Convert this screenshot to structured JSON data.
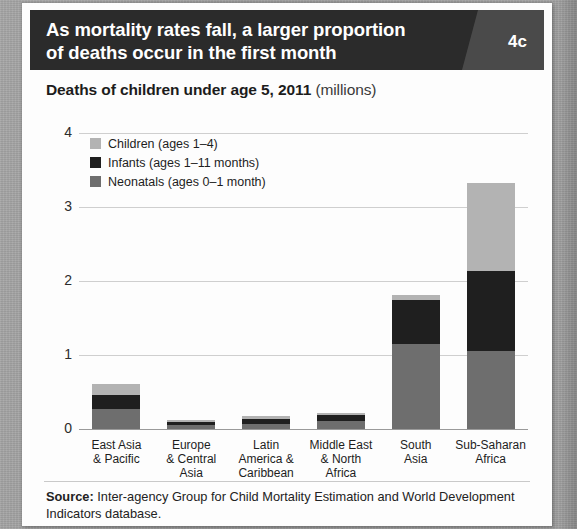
{
  "figure": {
    "badge": "4c",
    "title_lines": [
      "As mortality rates fall, a larger proportion",
      "of deaths occur in the first month"
    ],
    "subtitle_main": "Deaths of children under age 5, 2011",
    "subtitle_units": "(millions)",
    "source_label": "Source:",
    "source_text": " Inter-agency Group for Child Mortality Estimation and World Development Indicators database."
  },
  "colors": {
    "title_band": "#2b2b2b",
    "badge_panel": "#4a4a4a",
    "children": "#b3b3b3",
    "infants": "#1f1f1f",
    "neonatals": "#6e6e6e",
    "gridline": "#cfcfcf",
    "page_background": "#9f9f9f",
    "card_background": "#fdfdfd"
  },
  "chart_data": {
    "type": "bar",
    "stacked": true,
    "title": "Deaths of children under age 5, 2011 (millions)",
    "xlabel": "",
    "ylabel": "",
    "ylim": [
      0,
      4
    ],
    "yticks": [
      0,
      1,
      2,
      3,
      4
    ],
    "ytick_labels": [
      "0",
      "1",
      "2",
      "3",
      "4"
    ],
    "grid": true,
    "legend_position": "top-left",
    "categories": [
      "East Asia & Pacific",
      "Europe & Central Asia",
      "Latin America & Caribbean",
      "Middle East & North Africa",
      "South Asia",
      "Sub-Saharan Africa"
    ],
    "category_label_lines": [
      [
        "East Asia",
        "& Pacific"
      ],
      [
        "Europe",
        "& Central",
        "Asia"
      ],
      [
        "Latin",
        "America &",
        "Caribbean"
      ],
      [
        "Middle East",
        "& North",
        "Africa"
      ],
      [
        "South",
        "Asia"
      ],
      [
        "Sub-Saharan",
        "Africa"
      ]
    ],
    "series": [
      {
        "name": "Neonatals (ages 0-1 month)",
        "legend": "Neonatals (ages 0–1 month)",
        "color": "#6e6e6e",
        "values": [
          0.27,
          0.05,
          0.07,
          0.11,
          1.15,
          1.05
        ]
      },
      {
        "name": "Infants (ages 1-11 months)",
        "legend": "Infants (ages 1–11 months)",
        "color": "#1f1f1f",
        "values": [
          0.19,
          0.05,
          0.07,
          0.08,
          0.6,
          1.08
        ]
      },
      {
        "name": "Children (ages 1-4)",
        "legend": "Children (ages 1–4)",
        "color": "#b3b3b3",
        "values": [
          0.15,
          0.02,
          0.03,
          0.03,
          0.06,
          1.19
        ]
      }
    ],
    "totals": [
      0.61,
      0.12,
      0.17,
      0.22,
      1.81,
      3.32
    ]
  }
}
